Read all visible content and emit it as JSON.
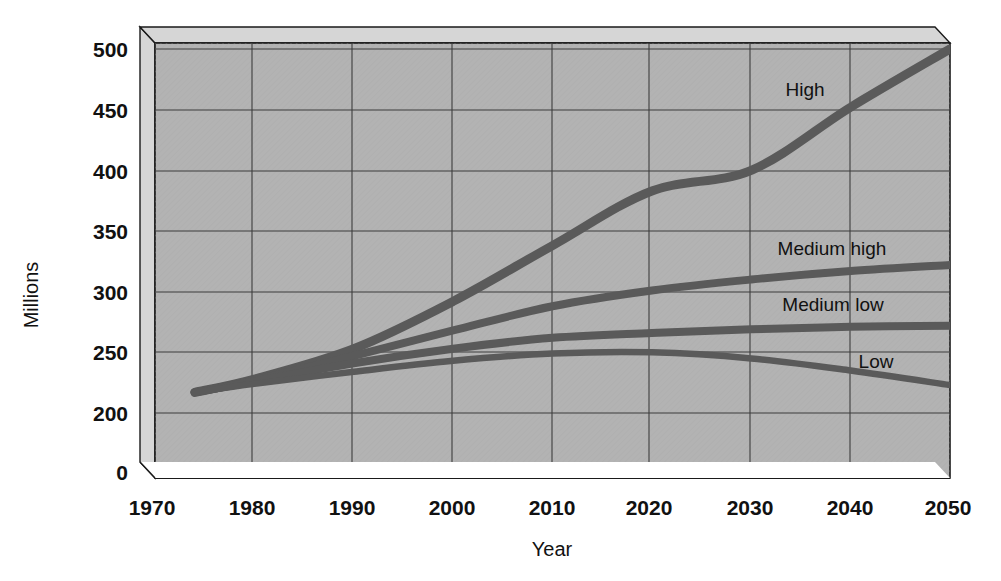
{
  "chart_data": {
    "type": "line",
    "title": "",
    "xlabel": "Year",
    "ylabel": "Millions",
    "xlim": [
      1970,
      2050
    ],
    "ylim": [
      200,
      500
    ],
    "y_axis_break": true,
    "grid": true,
    "legend_position": "inline-end-of-line",
    "xticks": [
      "1970",
      "1980",
      "1990",
      "2000",
      "2010",
      "2020",
      "2030",
      "2040",
      "2050"
    ],
    "yticks": [
      "0",
      "200",
      "250",
      "300",
      "350",
      "400",
      "450",
      "500"
    ],
    "x": [
      1974,
      1980,
      1990,
      2000,
      2010,
      2020,
      2030,
      2040,
      2050
    ],
    "series": [
      {
        "name": "High",
        "label": "High",
        "color": "#5a5a5a",
        "values": [
          217,
          228,
          253,
          292,
          338,
          383,
          400,
          452,
          500
        ]
      },
      {
        "name": "Medium high",
        "label": "Medium high",
        "color": "#5a5a5a",
        "values": [
          217,
          227,
          247,
          268,
          288,
          301,
          310,
          317,
          322
        ]
      },
      {
        "name": "Medium low",
        "label": "Medium low",
        "color": "#5a5a5a",
        "values": [
          217,
          226,
          241,
          253,
          262,
          266,
          269,
          271,
          272
        ]
      },
      {
        "name": "Low",
        "label": "Low",
        "color": "#5a5a5a",
        "values": [
          217,
          224,
          234,
          243,
          249,
          250,
          245,
          235,
          223
        ]
      }
    ],
    "annotations": [
      {
        "text": "High",
        "x": 805,
        "y": 96
      },
      {
        "text": "Medium  high",
        "x": 832,
        "y": 255
      },
      {
        "text": "Medium low",
        "x": 833,
        "y": 311
      },
      {
        "text": "Low",
        "x": 876,
        "y": 368
      }
    ]
  },
  "style": {
    "plot_fill": "#b3b3b3",
    "plot_wall_light": "#d6d6d6",
    "gridline": "#3d3d3d",
    "border": "#1a1a1a",
    "line_color": "#5a5a5a",
    "text_color": "#111111"
  }
}
